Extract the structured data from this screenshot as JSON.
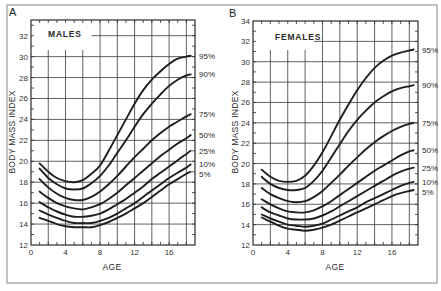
{
  "figure": {
    "frame_color": "#9a9a9a",
    "curve_color": "#1e1e1e"
  },
  "chart_data": [
    {
      "type": "line",
      "panel": "A",
      "title": "MALES",
      "xlabel": "AGE",
      "ylabel": "BODY MASS INDEX",
      "xlim": [
        0,
        19
      ],
      "ylim": [
        12,
        33.5
      ],
      "xticks": [
        0,
        4,
        8,
        12,
        16
      ],
      "yticks": [
        12,
        14,
        16,
        18,
        20,
        22,
        24,
        26,
        28,
        30,
        32
      ],
      "grid": true,
      "legend_position": "right-inline",
      "x": [
        1,
        2,
        3,
        4,
        5,
        6,
        7,
        8,
        9,
        10,
        11,
        12,
        13,
        14,
        15,
        16,
        17,
        18,
        18.5
      ],
      "series": [
        {
          "name": "95%",
          "values": [
            19.8,
            19.0,
            18.4,
            18.1,
            18.0,
            18.2,
            18.8,
            19.6,
            21.0,
            22.5,
            24.0,
            25.5,
            26.8,
            27.8,
            28.6,
            29.3,
            29.8,
            30.0,
            30.1
          ]
        },
        {
          "name": "90%",
          "values": [
            19.3,
            18.4,
            17.8,
            17.4,
            17.3,
            17.4,
            17.9,
            18.6,
            19.6,
            20.8,
            22.0,
            23.3,
            24.5,
            25.5,
            26.4,
            27.2,
            27.8,
            28.2,
            28.3
          ]
        },
        {
          "name": "75%",
          "values": [
            18.3,
            17.5,
            16.9,
            16.5,
            16.3,
            16.3,
            16.6,
            17.1,
            17.8,
            18.6,
            19.5,
            20.4,
            21.2,
            22.0,
            22.7,
            23.3,
            23.8,
            24.3,
            24.5
          ]
        },
        {
          "name": "50%",
          "values": [
            17.1,
            16.5,
            16.0,
            15.7,
            15.5,
            15.4,
            15.6,
            15.9,
            16.4,
            17.0,
            17.7,
            18.4,
            19.1,
            19.8,
            20.5,
            21.1,
            21.7,
            22.2,
            22.5
          ]
        },
        {
          "name": "25%",
          "values": [
            16.1,
            15.6,
            15.2,
            14.9,
            14.7,
            14.7,
            14.8,
            15.0,
            15.4,
            15.9,
            16.4,
            17.0,
            17.6,
            18.3,
            18.9,
            19.5,
            20.1,
            20.7,
            21.0
          ]
        },
        {
          "name": "10%",
          "values": [
            15.3,
            14.9,
            14.6,
            14.3,
            14.1,
            14.1,
            14.1,
            14.3,
            14.6,
            15.0,
            15.5,
            16.0,
            16.6,
            17.2,
            17.8,
            18.4,
            18.9,
            19.4,
            19.7
          ]
        },
        {
          "name": "5%",
          "values": [
            14.6,
            14.3,
            14.0,
            13.8,
            13.7,
            13.7,
            13.7,
            13.9,
            14.2,
            14.6,
            15.0,
            15.5,
            16.0,
            16.6,
            17.2,
            17.8,
            18.3,
            18.8,
            19.0
          ]
        }
      ]
    },
    {
      "type": "line",
      "panel": "B",
      "title": "FEMALES",
      "xlabel": "AGE",
      "ylabel": "BODY MASS INDEX",
      "xlim": [
        0,
        19
      ],
      "ylim": [
        12,
        34
      ],
      "xticks": [
        0,
        4,
        8,
        12,
        16
      ],
      "yticks": [
        12,
        14,
        16,
        18,
        20,
        22,
        24,
        26,
        28,
        30,
        32,
        34
      ],
      "grid": true,
      "legend_position": "right-inline",
      "x": [
        1,
        2,
        3,
        4,
        5,
        6,
        7,
        8,
        9,
        10,
        11,
        12,
        13,
        14,
        15,
        16,
        17,
        18,
        18.5
      ],
      "series": [
        {
          "name": "95%",
          "values": [
            19.4,
            18.7,
            18.3,
            18.2,
            18.3,
            18.8,
            19.8,
            21.1,
            22.7,
            24.3,
            25.8,
            27.2,
            28.4,
            29.4,
            30.1,
            30.6,
            30.9,
            31.1,
            31.2
          ]
        },
        {
          "name": "90%",
          "values": [
            18.7,
            18.0,
            17.6,
            17.4,
            17.4,
            17.6,
            18.3,
            19.3,
            20.6,
            21.9,
            23.2,
            24.3,
            25.2,
            26.0,
            26.6,
            27.1,
            27.4,
            27.6,
            27.7
          ]
        },
        {
          "name": "75%",
          "values": [
            17.6,
            17.0,
            16.6,
            16.3,
            16.2,
            16.3,
            16.7,
            17.3,
            18.1,
            18.9,
            19.8,
            20.6,
            21.4,
            22.1,
            22.7,
            23.2,
            23.6,
            23.9,
            24.0
          ]
        },
        {
          "name": "50%",
          "values": [
            16.5,
            16.0,
            15.6,
            15.3,
            15.2,
            15.2,
            15.4,
            15.8,
            16.3,
            16.9,
            17.5,
            18.1,
            18.7,
            19.3,
            19.8,
            20.3,
            20.8,
            21.2,
            21.3
          ]
        },
        {
          "name": "25%",
          "values": [
            15.7,
            15.2,
            14.9,
            14.6,
            14.5,
            14.5,
            14.6,
            14.9,
            15.3,
            15.8,
            16.3,
            16.8,
            17.3,
            17.8,
            18.3,
            18.8,
            19.2,
            19.5,
            19.6
          ]
        },
        {
          "name": "10%",
          "values": [
            15.0,
            14.6,
            14.3,
            14.0,
            13.9,
            13.8,
            13.9,
            14.1,
            14.5,
            14.9,
            15.3,
            15.7,
            16.2,
            16.6,
            17.0,
            17.4,
            17.8,
            18.1,
            18.2
          ]
        },
        {
          "name": "5%",
          "values": [
            14.7,
            14.3,
            13.9,
            13.6,
            13.5,
            13.4,
            13.5,
            13.7,
            14.0,
            14.4,
            14.8,
            15.2,
            15.6,
            16.0,
            16.4,
            16.8,
            17.1,
            17.3,
            17.4
          ]
        }
      ]
    }
  ]
}
